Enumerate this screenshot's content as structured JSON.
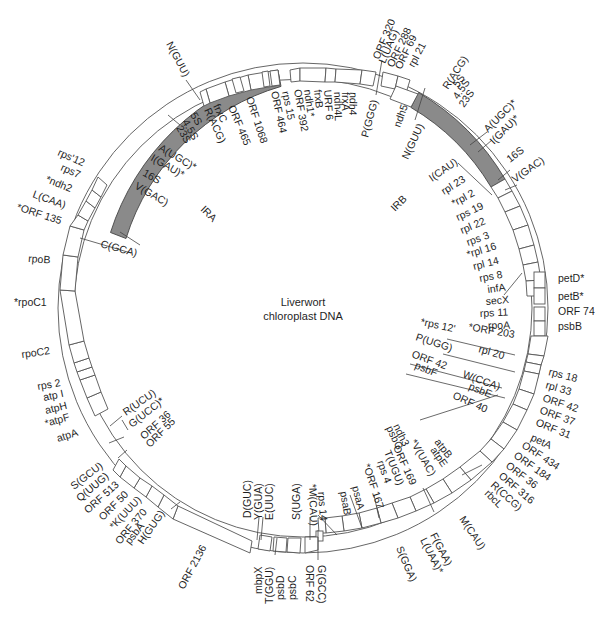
{
  "title": {
    "line1": "Liverwort",
    "line2": "chloroplast DNA"
  },
  "map": {
    "center": [
      303,
      308
    ],
    "outer_radius": 245,
    "inner_radius": 229,
    "ir_color": "#8a8a8a",
    "inverted_repeats": [
      {
        "name": "IRA",
        "label": "IRA",
        "start_deg": -52,
        "end_deg": -18,
        "label_pos": [
          206,
          208
        ],
        "label_rot": 45
      },
      {
        "name": "IRB",
        "label": "IRB",
        "start_deg": 18,
        "end_deg": 52,
        "label_pos": [
          398,
          205
        ],
        "label_rot": -45
      }
    ]
  },
  "genes_outside": [
    {
      "label": "ORF 320",
      "angle": 16
    },
    {
      "label": "L(UAG)",
      "angle": 18
    },
    {
      "label": "ORF 288",
      "angle": 20
    },
    {
      "label": "ORF 69",
      "angle": 22
    },
    {
      "label": "rpl 21",
      "angle": 24
    },
    {
      "label": "R(ACG)",
      "angle": 31
    },
    {
      "label": "5S",
      "angle": 33
    },
    {
      "label": "4.5S",
      "angle": 35
    },
    {
      "label": "23S",
      "angle": 37
    },
    {
      "label": "A(UGC)*",
      "angle": 45
    },
    {
      "label": "I(GAU)*",
      "angle": 48
    },
    {
      "label": "16S",
      "angle": 53
    },
    {
      "label": "V(GAC)",
      "angle": 56
    },
    {
      "label": "petD*",
      "angle": 80
    },
    {
      "label": "petB*",
      "angle": 84
    },
    {
      "label": "ORF 74",
      "angle": 88
    },
    {
      "label": "psbB",
      "angle": 92
    },
    {
      "label": "rps 18",
      "angle": 104
    },
    {
      "label": "rpl 33",
      "angle": 107
    },
    {
      "label": "ORF 42",
      "angle": 110
    },
    {
      "label": "ORF 37",
      "angle": 113
    },
    {
      "label": "ORF 31",
      "angle": 116
    },
    {
      "label": "petA",
      "angle": 121
    },
    {
      "label": "ORF 434",
      "angle": 126
    },
    {
      "label": "ORF 184",
      "angle": 129
    },
    {
      "label": "ORF 36",
      "angle": 132
    },
    {
      "label": "ORF 316",
      "angle": 135
    },
    {
      "label": "R(CCG)",
      "angle": 138
    },
    {
      "label": "rbcL",
      "angle": 141
    },
    {
      "label": "M(CAU)",
      "angle": 150
    },
    {
      "label": "F(GAA)",
      "angle": 160
    },
    {
      "label": "L(UAA)*",
      "angle": 163
    },
    {
      "label": "S(GGA)",
      "angle": 167
    },
    {
      "label": "G(GCC)",
      "angle": 178
    },
    {
      "label": "ORF 62",
      "angle": 181
    },
    {
      "label": "psbC",
      "angle": 186
    },
    {
      "label": "psbD",
      "angle": 189
    },
    {
      "label": "T(GGU)",
      "angle": 192
    },
    {
      "label": "mbpX",
      "angle": 195
    },
    {
      "label": "ORF 2136",
      "angle": 210
    },
    {
      "label": "H(GUG)",
      "angle": 222
    },
    {
      "label": "psbA",
      "angle": 225
    },
    {
      "label": "ORF 370",
      "angle": 228
    },
    {
      "label": "*K(UUU)",
      "angle": 231
    },
    {
      "label": "ORF 50",
      "angle": 234
    },
    {
      "label": "ORF 513",
      "angle": 237
    },
    {
      "label": "Q(UUG)",
      "angle": 240
    },
    {
      "label": "S(GCU)",
      "angle": 243
    },
    {
      "label": "atpA",
      "angle": 254
    },
    {
      "label": "*atpF",
      "angle": 258
    },
    {
      "label": "atpH",
      "angle": 261
    },
    {
      "label": "atp I",
      "angle": 264
    },
    {
      "label": "rps 2",
      "angle": 267
    },
    {
      "label": "rpoC2",
      "angle": 277
    },
    {
      "label": "*rpoC1",
      "angle": 291
    },
    {
      "label": "rpoB",
      "angle": 300
    },
    {
      "label": "*ORF 135",
      "angle": 311
    },
    {
      "label": "L(CAA)",
      "angle": 315
    },
    {
      "label": "*ndh2",
      "angle": 319
    },
    {
      "label": "rps7",
      "angle": 323
    },
    {
      "label": "rps'12",
      "angle": 327
    },
    {
      "label": "N(GUU)",
      "angle": -27
    }
  ],
  "genes_inside": [
    {
      "label": "5S",
      "angle": -33
    },
    {
      "label": "4.5S",
      "angle": -31
    },
    {
      "label": "23S",
      "angle": -29
    },
    {
      "label": "R(ACG)",
      "angle": -26
    },
    {
      "label": "frxC",
      "angle": -23
    },
    {
      "label": "ORF 465",
      "angle": -20
    },
    {
      "label": "ORF 1068",
      "angle": -14
    },
    {
      "label": "ORF 464",
      "angle": -8
    },
    {
      "label": "rps 15",
      "angle": -6
    },
    {
      "label": "ORF 392",
      "angle": -4
    },
    {
      "label": "ndh1*",
      "angle": -2
    },
    {
      "label": "frxB",
      "angle": 0
    },
    {
      "label": "URF 6",
      "angle": 2
    },
    {
      "label": "ndh4L",
      "angle": 4
    },
    {
      "label": "frxA",
      "angle": 6
    },
    {
      "label": "ndh4",
      "angle": 8
    },
    {
      "label": "P(GGG)",
      "angle": 12
    },
    {
      "label": "ndh5",
      "angle": 22
    },
    {
      "label": "N(GUU)",
      "angle": 27
    },
    {
      "label": "A(UGC)*",
      "angle": -40
    },
    {
      "label": "I(GAU)*",
      "angle": -43
    },
    {
      "label": "16S",
      "angle": -47
    },
    {
      "label": "V(GAC)",
      "angle": -50
    },
    {
      "label": "C(GCA)",
      "angle": -63
    },
    {
      "label": "I(CAU)",
      "angle": 58
    },
    {
      "label": "rpl 23",
      "angle": 61
    },
    {
      "label": "*rpl 2",
      "angle": 64
    },
    {
      "label": "rps 19",
      "angle": 67
    },
    {
      "label": "rpl 22",
      "angle": 70
    },
    {
      "label": "rps 3",
      "angle": 73
    },
    {
      "label": "*rpl 16",
      "angle": 76
    },
    {
      "label": "rpl 14",
      "angle": 79
    },
    {
      "label": "rps 8",
      "angle": 82
    },
    {
      "label": "infA",
      "angle": 85
    },
    {
      "label": "secX",
      "angle": 88
    },
    {
      "label": "rps 11",
      "angle": 91
    },
    {
      "label": "rpoA",
      "angle": 94
    },
    {
      "label": "*ORF 203",
      "angle": 101
    },
    {
      "label": "*rps 12'",
      "angle": 104
    },
    {
      "label": "rpl 20",
      "angle": 107
    },
    {
      "label": "P(UGG)",
      "angle": 110
    },
    {
      "label": "W(CCA)",
      "angle": 113
    },
    {
      "label": "ORF 42",
      "angle": 116
    },
    {
      "label": "psbE",
      "angle": 118
    },
    {
      "label": "psbF",
      "angle": 120
    },
    {
      "label": "ORF 40",
      "angle": 122
    },
    {
      "label": "atpB",
      "angle": 145
    },
    {
      "label": "atpE",
      "angle": 148
    },
    {
      "label": "*V(UAC)",
      "angle": 151
    },
    {
      "label": "ndh3",
      "angle": 154
    },
    {
      "label": "psbG",
      "angle": 156
    },
    {
      "label": "ORF 169",
      "angle": 158
    },
    {
      "label": "T(UGU)",
      "angle": 161
    },
    {
      "label": "rps 4",
      "angle": 164
    },
    {
      "label": "*ORF 167",
      "angle": 167
    },
    {
      "label": "psaA",
      "angle": 170
    },
    {
      "label": "psaB",
      "angle": 173
    },
    {
      "label": "rps 14",
      "angle": 176
    },
    {
      "label": "*M(CAU)",
      "angle": 178
    },
    {
      "label": "S(UGA)",
      "angle": 183
    },
    {
      "label": "E(UUC)",
      "angle": 190
    },
    {
      "label": "Y(GUA)",
      "angle": 192
    },
    {
      "label": "D(GUC)",
      "angle": 194
    },
    {
      "label": "ORF 55",
      "angle": 237
    },
    {
      "label": "ORF 36",
      "angle": 240
    },
    {
      "label": "G(UCC)*",
      "angle": 243
    },
    {
      "label": "R(UCU)",
      "angle": 246
    }
  ]
}
